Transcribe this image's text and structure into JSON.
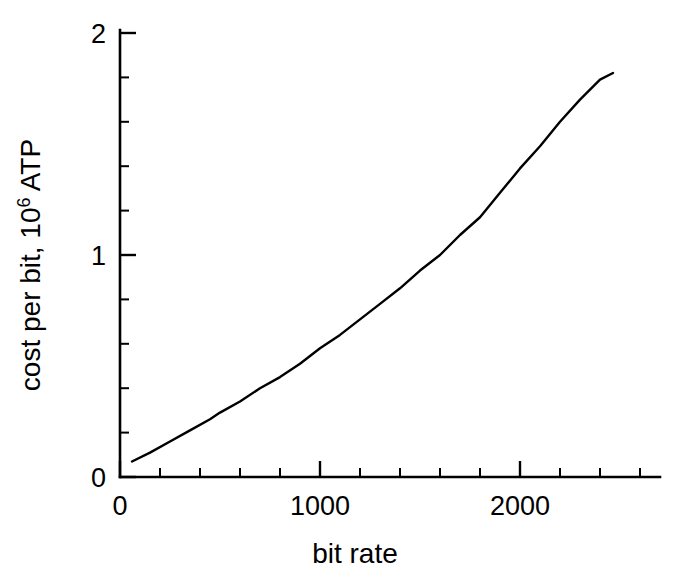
{
  "chart_data": {
    "type": "line",
    "title": "",
    "xlabel": "bit rate",
    "ylabel": "cost per bit, 10^6 ATP",
    "ylabel_text": "cost per bit, 10",
    "ylabel_superscript": "6",
    "ylabel_tail": " ATP",
    "xlim": [
      0,
      2600
    ],
    "ylim": [
      0,
      2
    ],
    "grid": false,
    "legend": null,
    "x_major_ticks": [
      0,
      1000,
      2000
    ],
    "x_major_tick_labels": [
      "0",
      "1000",
      "2000"
    ],
    "x_minor_tick_interval": 200,
    "x_minor_ticks": [
      200,
      400,
      600,
      800,
      1200,
      1400,
      1600,
      1800,
      2200,
      2400
    ],
    "y_major_ticks": [
      0,
      1,
      2
    ],
    "y_major_tick_labels": [
      "0",
      "1",
      "2"
    ],
    "y_minor_tick_interval": 0.2,
    "y_minor_ticks": [
      0.2,
      0.4,
      0.6,
      0.8,
      1.2,
      1.4,
      1.6,
      1.8
    ],
    "series": [
      {
        "name": "cost per bit",
        "color": "#000000",
        "x": [
          60,
          150,
          250,
          350,
          450,
          500,
          600,
          700,
          800,
          900,
          1000,
          1100,
          1200,
          1300,
          1400,
          1500,
          1600,
          1700,
          1800,
          1900,
          2000,
          2100,
          2200,
          2300,
          2400,
          2465
        ],
        "y": [
          0.07,
          0.11,
          0.16,
          0.21,
          0.26,
          0.29,
          0.34,
          0.4,
          0.45,
          0.51,
          0.58,
          0.64,
          0.71,
          0.78,
          0.85,
          0.93,
          1.0,
          1.09,
          1.17,
          1.28,
          1.39,
          1.49,
          1.6,
          1.7,
          1.79,
          1.82
        ]
      }
    ]
  },
  "axis_titles": {
    "x": "bit rate",
    "y_main": "cost per bit, 10",
    "y_sup": "6",
    "y_tail": " ATP"
  },
  "colors": {
    "background": "#ffffff",
    "foreground": "#000000",
    "curve": "#000000"
  }
}
